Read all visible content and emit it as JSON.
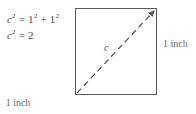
{
  "figure": {
    "type": "geometry-diagram",
    "background_color": "#ffffff",
    "line_color": "#5a5a5a",
    "text_color": "#4a4a4a"
  },
  "equations": [
    {
      "id": "eq1",
      "text": "c2 = 12 + 12",
      "parts": {
        "lhs_var": "c",
        "lhs_exp": "2",
        "equals": "=",
        "term1": "1",
        "term1_exp": "2",
        "plus": "+",
        "term2": "1",
        "term2_exp": "2"
      }
    },
    {
      "id": "eq2",
      "text": "c2 = 2",
      "parts": {
        "lhs_var": "c",
        "lhs_exp": "2",
        "equals": "=",
        "rhs": "2"
      }
    }
  ],
  "shape": {
    "name": "square",
    "side_length": "1 inch",
    "labels": {
      "bottom_side": "1 inch",
      "right_side": "1 inch",
      "diagonal": "c"
    },
    "diagonal": {
      "style": "dashed",
      "arrowhead": "top-right",
      "from": "bottom-left",
      "to": "top-right"
    }
  }
}
